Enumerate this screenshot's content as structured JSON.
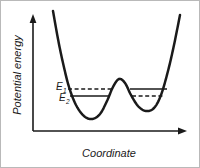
{
  "figure": {
    "kind": "potential-energy-diagram",
    "background_color": "#ffffff",
    "border_color": "#b9b9b9",
    "ink_color": "#1a1a1a"
  },
  "axes": {
    "y_label": "Potential energy",
    "x_label": "Coordinate",
    "y_arrow": "arrow-up-icon",
    "x_arrow": "arrow-right-icon",
    "origin": {
      "x": 32,
      "y": 130
    },
    "x_end": 186,
    "y_top": 14
  },
  "chart_data": {
    "type": "line",
    "title": "",
    "xlabel": "Coordinate",
    "ylabel": "Potential energy",
    "xlim": [
      0,
      1
    ],
    "ylim": [
      0,
      1
    ],
    "grid": false,
    "legend": null,
    "series": [
      {
        "name": "Potential energy curve",
        "style": "solid",
        "description": "asymmetric double-well potential with central barrier",
        "points": [
          [
            52,
            10
          ],
          [
            57,
            38
          ],
          [
            62,
            62
          ],
          [
            68,
            86
          ],
          [
            75,
            104
          ],
          [
            83,
            115
          ],
          [
            91,
            118
          ],
          [
            99,
            113
          ],
          [
            106,
            100
          ],
          [
            112,
            86
          ],
          [
            118,
            78
          ],
          [
            124,
            82
          ],
          [
            130,
            94
          ],
          [
            137,
            105
          ],
          [
            145,
            110
          ],
          [
            153,
            107
          ],
          [
            160,
            94
          ],
          [
            167,
            70
          ],
          [
            173,
            44
          ],
          [
            179,
            14
          ]
        ]
      }
    ],
    "annotations": [
      {
        "name": "E1",
        "label": "E",
        "subscript": "1",
        "label_x": 55,
        "label_y": 89,
        "level_y": 88,
        "left_segment": {
          "x1": 67,
          "x2": 110,
          "style": "dashed"
        },
        "right_segment": {
          "x1": 129,
          "x2": 166,
          "style": "solid"
        }
      },
      {
        "name": "E2",
        "label": "E",
        "subscript": "2",
        "label_x": 58,
        "label_y": 100,
        "level_y": 95,
        "left_segment": {
          "x1": 69,
          "x2": 108,
          "style": "solid"
        },
        "right_segment": {
          "x1": 131,
          "x2": 164,
          "style": "dashed"
        }
      }
    ]
  }
}
